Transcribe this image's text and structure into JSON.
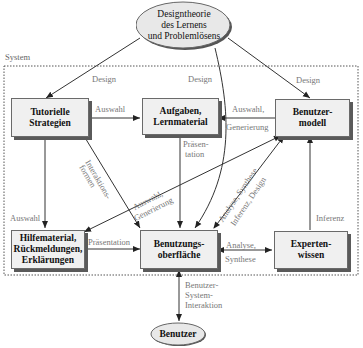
{
  "diagram": {
    "system_label": "System",
    "nodes": {
      "theory": "Designtheorie\ndes Lernens\nund Problemlösens",
      "tutorial": "Tutorielle\nStrategien",
      "tasks": "Aufgaben,\nLernmaterial",
      "usermodel": "Benutzer-\nmodell",
      "help": "Hilfematerial,\nRückmeldungen,\nErklärungen",
      "ui": "Benutzungs-\noberfläche",
      "expert": "Experten-\nwissen",
      "user": "Benutzer"
    },
    "edges": {
      "design_left": "Design",
      "design_mid": "Design",
      "design_right": "Design",
      "tutorial_tasks": "Auswahl",
      "usermodel_tasks_1": "Auswahl,",
      "usermodel_tasks_2": "Generierung",
      "tasks_ui_1": "Präsen-",
      "tasks_ui_2": "tation",
      "tutorial_ui_1": "Interaktions-",
      "tutorial_ui_2": "formen",
      "usermodel_help_1": "Auswahl,",
      "usermodel_help_2": "Generierung",
      "ui_usermodel_1": "Analyse, Synthese",
      "ui_usermodel_2": "Inferenz, Design",
      "tutorial_help": "Auswahl",
      "expert_usermodel": "Inferenz",
      "help_ui": "Präsentation",
      "ui_expert_1": "Analyse,",
      "ui_expert_2": "Synthese",
      "ui_user_1": "Benutzer-",
      "ui_user_2": "System-",
      "ui_user_3": "Interaktion"
    },
    "colors": {
      "node_fill": "#f0f0f0",
      "node_shadow": "#5a5a5a",
      "ellipse_fill": "#e8e8e8",
      "edge": "#333333",
      "label": "#777777"
    }
  }
}
